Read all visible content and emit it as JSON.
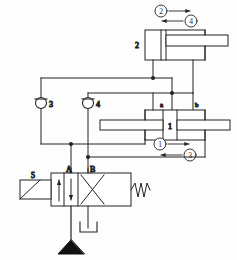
{
  "diagram": {
    "type": "hydraulic-schematic",
    "stroke_color": "#222222",
    "background_color": "#fdfdfd",
    "fill_color": "#ffffff"
  },
  "components": {
    "cylinder_2": {
      "id": "2",
      "label": "2",
      "name": "upper-cylinder"
    },
    "cylinder_1": {
      "id": "1",
      "label": "1",
      "name": "main-cylinder",
      "port_left_label": "a",
      "port_right_label": "b"
    },
    "check_valve_3": {
      "id": "3",
      "label": "3",
      "name": "check-valve-3"
    },
    "check_valve_4": {
      "id": "4",
      "label": "4",
      "name": "check-valve-4"
    },
    "valve_5": {
      "id": "5",
      "label": "5",
      "name": "directional-control-valve",
      "port_a_label": "A",
      "port_b_label": "B"
    }
  },
  "motion_labels": {
    "top_forward": "2",
    "top_reverse": "4",
    "mid_forward": "1",
    "mid_reverse": "3"
  },
  "sequence": {
    "steps": [
      "1",
      "2",
      "3",
      "4"
    ],
    "description": "Numbered stroke sequence of the two cylinders"
  }
}
